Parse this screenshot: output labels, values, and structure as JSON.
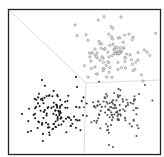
{
  "chart_data": {
    "type": "scatter",
    "title": "",
    "xlabel": "",
    "ylabel": "",
    "grid": false,
    "legend": null,
    "frame": {
      "x0": 8.5,
      "y0": 9.5,
      "x1": 160.5,
      "y1": 154.5,
      "stroke": "#222222"
    },
    "boundaries": {
      "color": "#dcdcdc",
      "segments": [
        {
          "x1": 10,
          "y1": 11,
          "x2": 86,
          "y2": 83
        },
        {
          "x1": 86,
          "y1": 83,
          "x2": 160,
          "y2": 80
        },
        {
          "x1": 86,
          "y1": 83,
          "x2": 84,
          "y2": 154
        }
      ]
    },
    "series": [
      {
        "name": "cluster-top-right",
        "color": "#9a9a9a",
        "marker": "ring",
        "center": [
          112,
          53
        ],
        "spread": [
          14,
          13
        ],
        "count": 95,
        "seed": 7,
        "outliers": [
          [
            121,
            17
          ],
          [
            75,
            25
          ],
          [
            133,
            37
          ],
          [
            147,
            52
          ],
          [
            143,
            81
          ]
        ]
      },
      {
        "name": "cluster-bottom-left",
        "color": "#1a1a1a",
        "marker": "dot",
        "center": [
          56,
          112
        ],
        "spread": [
          14,
          11
        ],
        "count": 110,
        "seed": 19,
        "outliers": [
          [
            22,
            114
          ],
          [
            28,
            132
          ],
          [
            31,
            131
          ],
          [
            42,
            80
          ],
          [
            76,
            77
          ],
          [
            77,
            87
          ]
        ]
      },
      {
        "name": "cluster-bottom-right",
        "color": "#555555",
        "marker": "dot",
        "center": [
          114,
          109
        ],
        "spread": [
          14,
          11
        ],
        "count": 110,
        "seed": 31,
        "outliers": [
          [
            109,
            145
          ],
          [
            113,
            147
          ],
          [
            145,
            85
          ],
          [
            139,
            94
          ]
        ]
      }
    ]
  }
}
